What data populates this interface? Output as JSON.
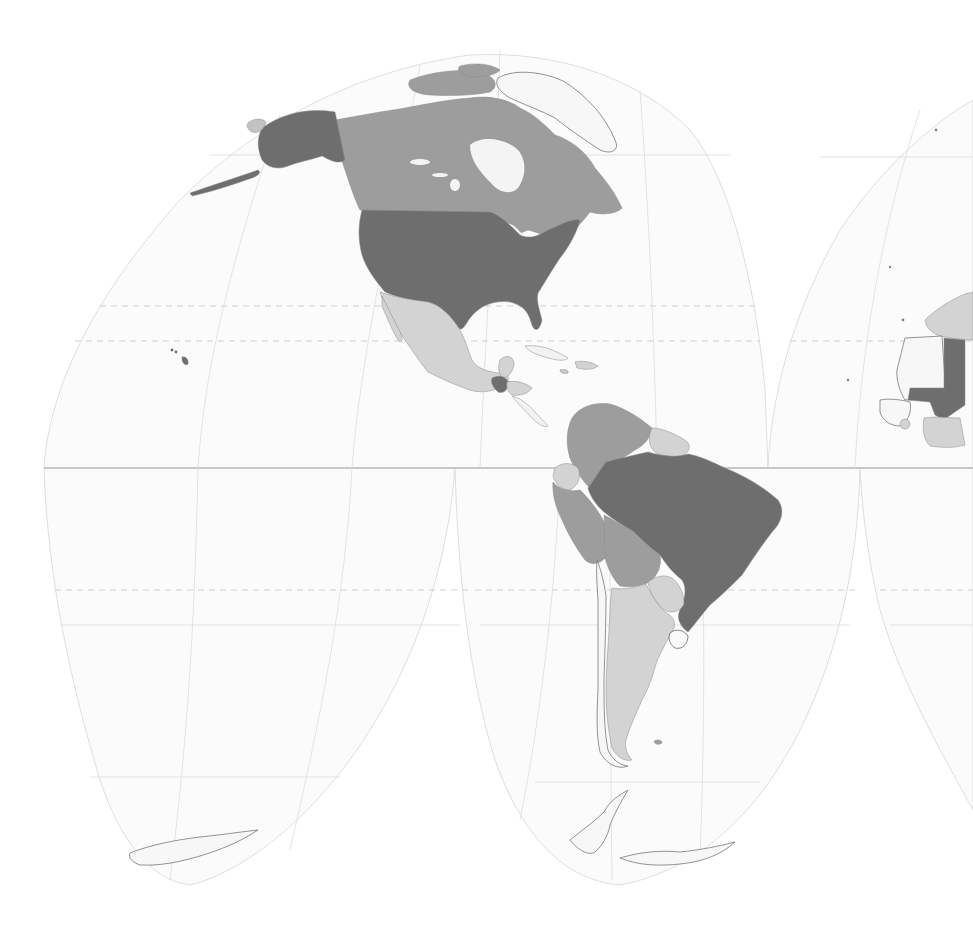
{
  "map": {
    "projection": "Interrupted Goode Homolosine",
    "style": "grayscale choropleth",
    "visible_region": "Americas (full), western edge of Africa",
    "graticule": {
      "equator": "solid line",
      "interrupt_parallels": "dashed lines near ±40° latitude",
      "meridians": "faint thin lines"
    },
    "classes": [
      {
        "id": "high",
        "fill": "#6e6e6e"
      },
      {
        "id": "medium",
        "fill": "#9d9d9d"
      },
      {
        "id": "low",
        "fill": "#d3d3d3"
      },
      {
        "id": "no-data",
        "fill": "#f7f7f7"
      }
    ],
    "countries": [
      {
        "name": "United States",
        "class": "high"
      },
      {
        "name": "Alaska (US)",
        "class": "high"
      },
      {
        "name": "Hawaii (US)",
        "class": "high"
      },
      {
        "name": "Canada",
        "class": "medium"
      },
      {
        "name": "Mexico",
        "class": "low"
      },
      {
        "name": "Guatemala",
        "class": "high"
      },
      {
        "name": "Belize",
        "class": "low"
      },
      {
        "name": "Honduras",
        "class": "low"
      },
      {
        "name": "Cuba",
        "class": "no-data"
      },
      {
        "name": "Hispaniola",
        "class": "low"
      },
      {
        "name": "Colombia",
        "class": "medium"
      },
      {
        "name": "Venezuela",
        "class": "medium"
      },
      {
        "name": "Guyana / Suriname / French Guiana",
        "class": "low"
      },
      {
        "name": "Ecuador",
        "class": "low"
      },
      {
        "name": "Peru",
        "class": "medium"
      },
      {
        "name": "Bolivia",
        "class": "medium"
      },
      {
        "name": "Brazil",
        "class": "high"
      },
      {
        "name": "Paraguay",
        "class": "low"
      },
      {
        "name": "Uruguay",
        "class": "no-data"
      },
      {
        "name": "Argentina",
        "class": "low"
      },
      {
        "name": "Chile",
        "class": "no-data"
      },
      {
        "name": "Greenland",
        "class": "no-data"
      },
      {
        "name": "Chukotka (Russia)",
        "class": "low"
      },
      {
        "name": "Antarctica",
        "class": "no-data"
      },
      {
        "name": "Mauritania",
        "class": "no-data"
      },
      {
        "name": "Mali",
        "class": "high"
      },
      {
        "name": "Algeria / Morocco",
        "class": "low"
      },
      {
        "name": "Côte d'Ivoire region",
        "class": "low"
      },
      {
        "name": "Senegal / Guinea coast",
        "class": "no-data"
      }
    ]
  }
}
